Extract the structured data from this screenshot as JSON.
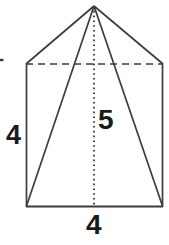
{
  "figure": {
    "name": "square-pyramid-on-rectangular-prism",
    "stroke_color": "#3c3c3c",
    "label_color": "#1a1a1a",
    "background_color": "#ffffff"
  },
  "labels": {
    "height_left": "4",
    "slant_center": "5",
    "base_bottom": "4"
  },
  "geometry": {
    "apex": {
      "x": 94,
      "y": 6
    },
    "rect_top_left": {
      "x": 26,
      "y": 64
    },
    "rect_top_right": {
      "x": 163,
      "y": 64
    },
    "rect_bottom_left": {
      "x": 26,
      "y": 207
    },
    "rect_bottom_right": {
      "x": 163,
      "y": 207
    },
    "altitude_line": {
      "x": 94,
      "y1": 6,
      "y2": 207
    },
    "dashed_top_edge": {
      "x1": 26,
      "y1": 64,
      "x2": 163,
      "y2": 64
    },
    "left_slant_edge": {
      "x1": 26,
      "y1": 64,
      "x2": 94,
      "y2": 6
    },
    "right_slant_edge": {
      "x1": 94,
      "y1": 6,
      "x2": 163,
      "y2": 64
    },
    "left_lateral_edge": {
      "x1": 94,
      "y1": 6,
      "x2": 26,
      "y2": 207
    },
    "right_lateral_edge": {
      "x1": 94,
      "y1": 6,
      "x2": 163,
      "y2": 207
    },
    "edge_tick_left": {
      "x1": 0,
      "y1": 60,
      "x2": 3,
      "y2": 60
    }
  }
}
